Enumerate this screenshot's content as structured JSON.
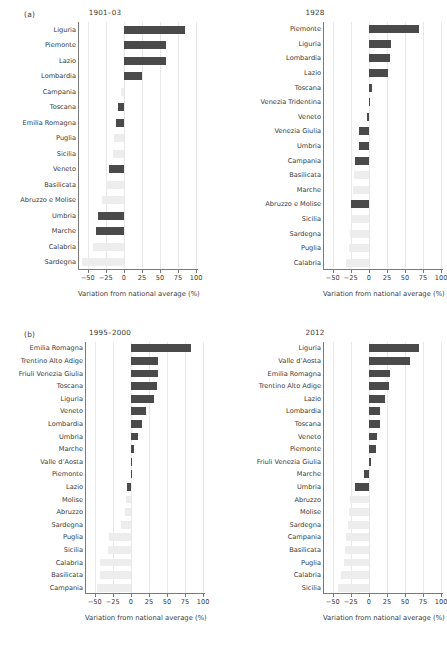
{
  "figure": {
    "panels": [
      {
        "tag": "(a)",
        "charts": [
          {
            "title": "1901–03",
            "xlabel": "Variation from national average (%)",
            "xticks": [
              -50,
              -25,
              0,
              25,
              50,
              75,
              100
            ],
            "xticklabels": [
              "−50",
              "−25",
              "0",
              "25",
              "50",
              "75",
              "100"
            ],
            "xlim": [
              -62,
              104
            ],
            "categories": [
              "Liguria",
              "Piemonte",
              "Lazio",
              "Lombardia",
              "Campania",
              "Toscana",
              "Emilia Romagna",
              "Puglia",
              "Sicilia",
              "Veneto",
              "Basilicata",
              "Abruzzo e Molise",
              "Umbria",
              "Marche",
              "Calabria",
              "Sardegna"
            ],
            "values": [
              85,
              58,
              58,
              25,
              -4,
              -8,
              -11,
              -14,
              -15,
              -20,
              -25,
              -30,
              -36,
              -38,
              -43,
              -58
            ],
            "highlight": [
              true,
              true,
              true,
              true,
              false,
              true,
              true,
              false,
              false,
              true,
              false,
              false,
              true,
              true,
              false,
              false
            ]
          },
          {
            "title": "1928",
            "xlabel": "Variation from national average (%)",
            "xticks": [
              -50,
              -25,
              0,
              25,
              50,
              75,
              100
            ],
            "xticklabels": [
              "−50",
              "−25",
              "0",
              "25",
              "50",
              "75",
              "100"
            ],
            "xlim": [
              -62,
              104
            ],
            "categories": [
              "Piemonte",
              "Liguria",
              "Lombardia",
              "Lazio",
              "Toscana",
              "Venezia Tridentina",
              "Veneto",
              "Venezia Giulia",
              "Umbria",
              "Campania",
              "Basilicata",
              "Marche",
              "Abruzzo e Molise",
              "Sicilia",
              "Sardegna",
              "Puglia",
              "Calabria"
            ],
            "values": [
              69,
              31,
              29,
              26,
              4,
              1,
              -2,
              -13,
              -14,
              -19,
              -21,
              -22,
              -24,
              -25,
              -26,
              -28,
              -31,
              -34
            ],
            "highlight": [
              true,
              true,
              true,
              true,
              true,
              true,
              true,
              true,
              true,
              true,
              false,
              false,
              true,
              false,
              false,
              false,
              false,
              false
            ]
          }
        ]
      },
      {
        "tag": "(b)",
        "charts": [
          {
            "title": "1995–2000",
            "xlabel": "Variation from national average (%)",
            "xticks": [
              -50,
              -25,
              0,
              25,
              50,
              75,
              100
            ],
            "xticklabels": [
              "−50",
              "−25",
              "0",
              "25",
              "50",
              "75",
              "100"
            ],
            "xlim": [
              -62,
              104
            ],
            "categories": [
              "Emilia Romagna",
              "Trentino Alto Adige",
              "Friuli Venezia Giulia",
              "Toscana",
              "Liguria",
              "Veneto",
              "Lombardia",
              "Umbria",
              "Marche",
              "Valle d’Aosta",
              "Piemonte",
              "Lazio",
              "Molise",
              "Abruzzo",
              "Sardegna",
              "Puglia",
              "Sicilia",
              "Calabria",
              "Basilicata",
              "Campania"
            ],
            "values": [
              83,
              38,
              37,
              36,
              32,
              21,
              16,
              10,
              5,
              1,
              1,
              -5,
              -7,
              -8,
              -14,
              -30,
              -32,
              -42,
              -43,
              -47
            ],
            "highlight": [
              true,
              true,
              true,
              true,
              true,
              true,
              true,
              true,
              true,
              true,
              true,
              true,
              false,
              false,
              false,
              false,
              false,
              false,
              false,
              false
            ]
          },
          {
            "title": "2012",
            "xlabel": "Variation from national average (%)",
            "xticks": [
              -50,
              -25,
              0,
              25,
              50,
              75,
              100
            ],
            "xticklabels": [
              "−50",
              "−25",
              "0",
              "25",
              "50",
              "75",
              "100"
            ],
            "xlim": [
              -62,
              104
            ],
            "categories": [
              "Liguria",
              "Valle d’Aosta",
              "Emilia Romagna",
              "Trentino Alto Adige",
              "Lazio",
              "Lombardia",
              "Toscana",
              "Veneto",
              "Piemonte",
              "Friuli Venezia Giulia",
              "Marche",
              "Umbria",
              "Abruzzo",
              "Molise",
              "Sardegna",
              "Campania",
              "Basilicata",
              "Puglia",
              "Calabria",
              "Sicilia"
            ],
            "values": [
              70,
              57,
              30,
              28,
              23,
              16,
              15,
              12,
              10,
              3,
              -6,
              -19,
              -26,
              -27,
              -29,
              -31,
              -33,
              -35,
              -38,
              -42
            ],
            "highlight": [
              true,
              true,
              true,
              true,
              true,
              true,
              true,
              true,
              true,
              true,
              true,
              true,
              false,
              false,
              false,
              false,
              false,
              false,
              false,
              false
            ]
          }
        ]
      }
    ]
  },
  "chart_data": [
    {
      "type": "bar",
      "orientation": "horizontal",
      "title": "1901–03",
      "panel": "(a)",
      "xlabel": "Variation from national average (%)",
      "ylabel": "",
      "xlim": [
        -62,
        104
      ],
      "grid": "vertical",
      "legend": "none",
      "categories": [
        "Liguria",
        "Piemonte",
        "Lazio",
        "Lombardia",
        "Campania",
        "Toscana",
        "Emilia Romagna",
        "Puglia",
        "Sicilia",
        "Veneto",
        "Basilicata",
        "Abruzzo e Molise",
        "Umbria",
        "Marche",
        "Calabria",
        "Sardegna"
      ],
      "values": [
        85,
        58,
        58,
        25,
        -4,
        -8,
        -11,
        -14,
        -15,
        -20,
        -25,
        -30,
        -36,
        -38,
        -43,
        -58
      ]
    },
    {
      "type": "bar",
      "orientation": "horizontal",
      "title": "1928",
      "panel": "(a)",
      "xlabel": "Variation from national average (%)",
      "ylabel": "",
      "xlim": [
        -62,
        104
      ],
      "grid": "vertical",
      "legend": "none",
      "categories": [
        "Piemonte",
        "Liguria",
        "Lombardia",
        "Lazio",
        "Emilia Romagna",
        "Toscana",
        "Venezia Tridentina",
        "Veneto",
        "Venezia Giulia",
        "Umbria",
        "Campania",
        "Basilicata",
        "Marche",
        "Abruzzo e Molise",
        "Sicilia",
        "Sardegna",
        "Puglia",
        "Calabria"
      ],
      "values": [
        69,
        31,
        29,
        26,
        4,
        1,
        -2,
        -13,
        -14,
        -19,
        -21,
        -22,
        -24,
        -25,
        -26,
        -28,
        -31,
        -34
      ]
    },
    {
      "type": "bar",
      "orientation": "horizontal",
      "title": "1995–2000",
      "panel": "(b)",
      "xlabel": "Variation from national average (%)",
      "ylabel": "",
      "xlim": [
        -62,
        104
      ],
      "grid": "vertical",
      "legend": "none",
      "categories": [
        "Emilia Romagna",
        "Trentino Alto Adige",
        "Friuli Venezia Giulia",
        "Toscana",
        "Liguria",
        "Veneto",
        "Lombardia",
        "Umbria",
        "Marche",
        "Valle d’Aosta",
        "Piemonte",
        "Lazio",
        "Molise",
        "Abruzzo",
        "Sardegna",
        "Puglia",
        "Sicilia",
        "Calabria",
        "Basilicata",
        "Campania"
      ],
      "values": [
        83,
        38,
        37,
        36,
        32,
        21,
        16,
        10,
        5,
        1,
        1,
        -5,
        -7,
        -8,
        -14,
        -30,
        -32,
        -42,
        -43,
        -47
      ]
    },
    {
      "type": "bar",
      "orientation": "horizontal",
      "title": "2012",
      "panel": "(b)",
      "xlabel": "Variation from national average (%)",
      "ylabel": "",
      "xlim": [
        -62,
        104
      ],
      "grid": "vertical",
      "legend": "none",
      "categories": [
        "Liguria",
        "Valle d’Aosta",
        "Emilia Romagna",
        "Trentino Alto Adige",
        "Lazio",
        "Lombardia",
        "Toscana",
        "Veneto",
        "Piemonte",
        "Friuli Venezia Giulia",
        "Marche",
        "Umbria",
        "Abruzzo",
        "Molise",
        "Sardegna",
        "Campania",
        "Basilicata",
        "Puglia",
        "Calabria",
        "Sicilia"
      ],
      "values": [
        70,
        57,
        30,
        28,
        23,
        16,
        15,
        12,
        10,
        3,
        -6,
        -19,
        -26,
        -27,
        -29,
        -31,
        -33,
        -35,
        -38,
        -42
      ]
    }
  ],
  "colors": {
    "bar_highlight": "#4a4a4a",
    "bar_muted": "#ededed",
    "grid": "#e8e8e8",
    "axis": "#7a7a7a",
    "text": "#3b3b3b"
  }
}
